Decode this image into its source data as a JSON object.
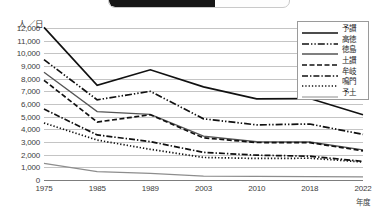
{
  "top_artifact": {
    "name": "cropped-tab"
  },
  "chart_data": {
    "type": "line",
    "title": "",
    "xlabel": "年度",
    "ylabel": "人／日",
    "yunit_label": "人／日",
    "xunit_label": "年度",
    "ylim": [
      0,
      12000
    ],
    "ytick_step": 1000,
    "grid": true,
    "legend_position": "top-right",
    "categories": [
      "1975",
      "1985",
      "1989",
      "2003",
      "2010",
      "2018",
      "2022"
    ],
    "x": [
      1975,
      1985,
      1989,
      2003,
      2010,
      2018,
      2022
    ],
    "yticks": [
      "0",
      "1,000",
      "2,000",
      "3,000",
      "4,000",
      "5,000",
      "6,000",
      "7,000",
      "8,000",
      "9,000",
      "10,000",
      "11,000",
      "12,000"
    ],
    "ytick_values": [
      0,
      1000,
      2000,
      3000,
      4000,
      5000,
      6000,
      7000,
      8000,
      9000,
      10000,
      11000,
      12000
    ],
    "series": [
      {
        "name": "予讃",
        "style": "solid-thick",
        "color": "#111111",
        "values": [
          12050,
          7480,
          8700,
          7350,
          6400,
          6430,
          5150
        ]
      },
      {
        "name": "高徳",
        "style": "dash-dot-dot",
        "color": "#111111",
        "values": [
          9500,
          6330,
          7000,
          4830,
          4350,
          4420,
          3600
        ]
      },
      {
        "name": "徳島",
        "style": "solid-thin",
        "color": "#555555",
        "values": [
          8500,
          5400,
          5180,
          3460,
          3020,
          3000,
          2370
        ]
      },
      {
        "name": "土讃",
        "style": "dashed",
        "color": "#111111",
        "values": [
          7870,
          4580,
          5150,
          3330,
          2960,
          2950,
          2300
        ]
      },
      {
        "name": "牟岐",
        "style": "dash-dot",
        "color": "#111111",
        "values": [
          5600,
          3560,
          3030,
          2180,
          1960,
          1880,
          1470
        ]
      },
      {
        "name": "鳴門",
        "style": "dotted",
        "color": "#111111",
        "values": [
          4500,
          3150,
          2420,
          1780,
          1700,
          1720,
          1420
        ]
      },
      {
        "name": "予土",
        "style": "solid-light",
        "color": "#8d8d8d",
        "values": [
          1310,
          660,
          520,
          300,
          280,
          270,
          240
        ]
      }
    ]
  }
}
